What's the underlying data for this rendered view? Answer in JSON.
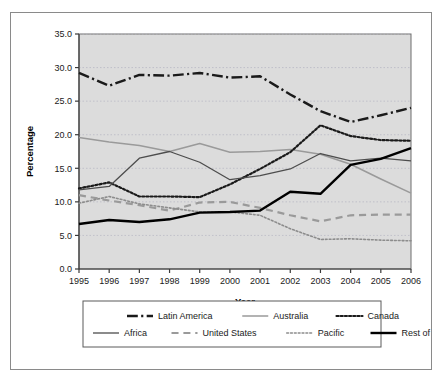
{
  "chart_data": {
    "type": "line",
    "title": "",
    "xlabel": "Year",
    "ylabel": "Percentage",
    "categories": [
      "1995",
      "1996",
      "1997",
      "1998",
      "1999",
      "2000",
      "2001",
      "2002",
      "2003",
      "2004",
      "2005",
      "2006"
    ],
    "x": [
      1995,
      1996,
      1997,
      1998,
      1999,
      2000,
      2001,
      2002,
      2003,
      2004,
      2005,
      2006
    ],
    "xlim": [
      1995,
      2006
    ],
    "ylim": [
      0.0,
      35.0
    ],
    "yticks": [
      "0.0",
      "5.0",
      "10.0",
      "15.0",
      "20.0",
      "25.0",
      "30.0",
      "35.0"
    ],
    "ytick_values": [
      0.0,
      5.0,
      10.0,
      15.0,
      20.0,
      25.0,
      30.0,
      35.0
    ],
    "grid": true,
    "grid_axis": "y",
    "legend_position": "bottom",
    "plot_background": "#dcdcdc",
    "series": [
      {
        "name": "Latin America",
        "style": "dash-dot",
        "color": "#1a1a1a",
        "width": 2.4,
        "values": [
          29.2,
          27.3,
          28.9,
          28.8,
          29.2,
          28.5,
          28.7,
          26.0,
          23.5,
          21.9,
          22.9,
          24.0
        ]
      },
      {
        "name": "Australia",
        "style": "solid",
        "color": "#9a9a9a",
        "width": 1.5,
        "values": [
          19.6,
          18.9,
          18.4,
          17.5,
          18.7,
          17.4,
          17.5,
          17.8,
          17.1,
          15.6,
          13.4,
          11.3
        ]
      },
      {
        "name": "Canada",
        "style": "dotted",
        "color": "#1a1a1a",
        "width": 2.2,
        "values": [
          12.0,
          12.9,
          10.8,
          10.8,
          10.7,
          12.6,
          14.9,
          17.4,
          21.4,
          19.8,
          19.2,
          19.1
        ]
      },
      {
        "name": "Africa",
        "style": "solid",
        "color": "#4d4d4d",
        "width": 1.3,
        "values": [
          11.8,
          12.3,
          16.5,
          17.5,
          15.9,
          13.3,
          13.9,
          14.9,
          17.2,
          16.1,
          16.5,
          16.1
        ]
      },
      {
        "name": "United States",
        "style": "dashed",
        "color": "#9a9a9a",
        "width": 2.2,
        "values": [
          11.0,
          10.2,
          9.5,
          8.7,
          9.9,
          10.0,
          9.1,
          8.0,
          7.1,
          8.0,
          8.1,
          8.1
        ]
      },
      {
        "name": "Pacific",
        "style": "fine-dotted",
        "color": "#8c8c8c",
        "width": 1.6,
        "values": [
          9.8,
          10.8,
          9.7,
          9.1,
          8.5,
          8.5,
          8.0,
          6.0,
          4.4,
          4.5,
          4.3,
          4.2
        ]
      },
      {
        "name": "Rest of world",
        "style": "solid",
        "color": "#000000",
        "width": 2.4,
        "values": [
          6.7,
          7.3,
          7.0,
          7.4,
          8.4,
          8.5,
          8.7,
          11.5,
          11.2,
          15.5,
          16.4,
          18.0
        ]
      }
    ]
  },
  "legend": {
    "row1": [
      "Latin America",
      "Australia",
      "Canada"
    ],
    "row2": [
      "Africa",
      "United States",
      "Pacific",
      "Rest of world"
    ]
  }
}
